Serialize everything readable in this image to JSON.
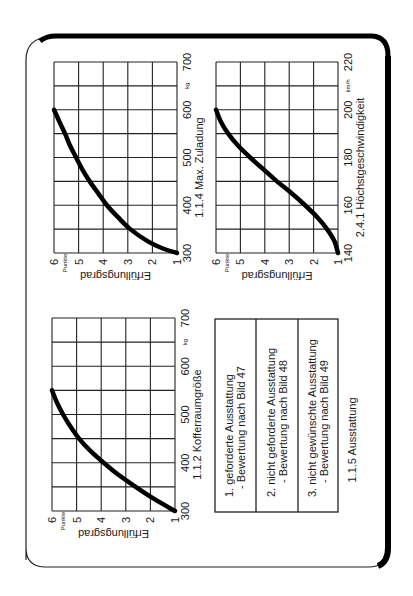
{
  "page": {
    "orientation": "rotated-90-ccw"
  },
  "chart_data": [
    {
      "id": "zuladung",
      "type": "line",
      "title": "1.1.4 Max. Zuladung",
      "xlabel": "kg",
      "ylabel": "Erfüllungsgrad",
      "yunit": "Punkte",
      "xlim": [
        300,
        700
      ],
      "ylim": [
        1,
        6
      ],
      "x_ticks": [
        "300",
        "400",
        "500",
        "600",
        "700"
      ],
      "y_ticks": [
        "1",
        "2",
        "3",
        "4",
        "5",
        "6"
      ],
      "x_grid_step": 50,
      "grid": true,
      "series": [
        {
          "name": "Erfüllungsgrad",
          "x": [
            300,
            310,
            325,
            350,
            375,
            400,
            425,
            450,
            475,
            500,
            525,
            550,
            575,
            600
          ],
          "y": [
            1.0,
            1.6,
            2.2,
            2.9,
            3.4,
            3.85,
            4.2,
            4.55,
            4.85,
            5.1,
            5.35,
            5.55,
            5.78,
            6.0
          ]
        }
      ]
    },
    {
      "id": "hoechstgeschwindigkeit",
      "type": "line",
      "title": "2.4.1 Höchstgeschwindigkeit",
      "xlabel": "km/h",
      "ylabel": "Erfüllungsgrad",
      "yunit": "Punkte",
      "xlim": [
        140,
        220
      ],
      "ylim": [
        1,
        6
      ],
      "x_ticks": [
        "140",
        "160",
        "180",
        "200",
        "220"
      ],
      "y_ticks": [
        "1",
        "2",
        "3",
        "4",
        "5",
        "6"
      ],
      "x_grid_step": 10,
      "grid": true,
      "series": [
        {
          "name": "Erfüllungsgrad",
          "x": [
            140,
            145,
            150,
            155,
            160,
            165,
            170,
            175,
            180,
            185,
            190,
            195,
            200
          ],
          "y": [
            1.0,
            1.15,
            1.45,
            1.85,
            2.35,
            2.9,
            3.5,
            4.05,
            4.6,
            5.1,
            5.5,
            5.8,
            6.0
          ]
        }
      ]
    },
    {
      "id": "kofferraum",
      "type": "line",
      "title": "1.1.2 Kofferraumgröße",
      "xlabel": "kg",
      "ylabel": "Erfüllungsgrad",
      "yunit": "Punkte",
      "xlim": [
        300,
        700
      ],
      "ylim": [
        1,
        6
      ],
      "x_ticks": [
        "300",
        "400",
        "500",
        "600",
        "700"
      ],
      "y_ticks": [
        "1",
        "2",
        "3",
        "4",
        "5",
        "6"
      ],
      "x_grid_step": 50,
      "grid": true,
      "series": [
        {
          "name": "Erfüllungsgrad",
          "x": [
            300,
            325,
            350,
            375,
            400,
            425,
            450,
            475,
            500,
            525,
            550
          ],
          "y": [
            1.0,
            1.85,
            2.6,
            3.3,
            3.9,
            4.45,
            4.9,
            5.25,
            5.55,
            5.8,
            6.0
          ]
        }
      ]
    }
  ],
  "ausstattung": {
    "title": "1.1.5 Ausstattung",
    "rows": [
      {
        "line1": "1. geforderte Ausstattung",
        "line2": "- Bewertung nach Bild 47"
      },
      {
        "line1": "2. nicht geforderte Ausstattung",
        "line2": "- Bewertung nach Bild 48"
      },
      {
        "line1": "3. nicht gewünschte Ausstattung",
        "line2": "- Bewertung nach Bild 49"
      }
    ]
  }
}
